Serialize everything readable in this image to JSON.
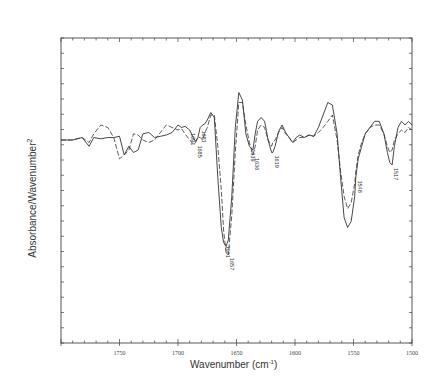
{
  "chart_data": {
    "type": "line",
    "title": "",
    "xlabel": "Wavenumber (cm⁻¹)",
    "xlabel_base": "Wavenumber (cm",
    "xlabel_sup": "-1",
    "xlabel_tail": ")",
    "ylabel": "Absorbance/Wavenumber²",
    "ylabel_base": "Absorbance/Wavenumber",
    "ylabel_sup": "2",
    "xlim": [
      1800,
      1500
    ],
    "x_reversed": true,
    "x_ticks": [
      1750,
      1700,
      1650,
      1600,
      1550,
      1500
    ],
    "x_tick_labels": [
      "1750",
      "1700",
      "1650",
      "1600",
      "1550",
      "1500"
    ],
    "y_tick_labels": [],
    "grid": false,
    "legend": null,
    "series": [
      {
        "name": "solid",
        "style": "solid",
        "x": [
          1800,
          1790,
          1782,
          1776,
          1772,
          1766,
          1760,
          1755,
          1750,
          1746,
          1742,
          1738,
          1734,
          1730,
          1725,
          1720,
          1715,
          1710,
          1705,
          1700,
          1697,
          1694,
          1690,
          1687,
          1685,
          1683,
          1681,
          1679,
          1677,
          1675,
          1672,
          1669,
          1666,
          1663,
          1661,
          1659,
          1657,
          1654,
          1651,
          1648,
          1645,
          1642,
          1639,
          1636,
          1634,
          1632,
          1629,
          1626,
          1623,
          1620,
          1619,
          1617,
          1614,
          1611,
          1608,
          1605,
          1602,
          1599,
          1596,
          1592,
          1588,
          1584,
          1580,
          1576,
          1572,
          1568,
          1564,
          1561,
          1558,
          1555,
          1552,
          1549,
          1548,
          1546,
          1543,
          1540,
          1536,
          1532,
          1528,
          1524,
          1521,
          1519,
          1517,
          1515,
          1512,
          1509,
          1506,
          1503,
          1500
        ],
        "y": [
          0,
          0,
          0.02,
          -0.05,
          0.02,
          0.01,
          0.02,
          0.02,
          0.03,
          -0.12,
          -0.05,
          -0.1,
          -0.08,
          0.05,
          0.06,
          0.02,
          0.03,
          0.04,
          0.06,
          0.12,
          0.1,
          0.11,
          0.08,
          0.02,
          -0.01,
          0.02,
          0.1,
          0.12,
          0.13,
          0.16,
          0.22,
          0.18,
          -0.3,
          -0.7,
          -0.82,
          -0.85,
          -0.8,
          -0.45,
          0.1,
          0.38,
          0.32,
          0.05,
          -0.05,
          -0.08,
          0.05,
          0.15,
          0.18,
          0.15,
          0.0,
          -0.1,
          -0.1,
          -0.05,
          0.07,
          0.12,
          0.06,
          0.02,
          -0.02,
          0.02,
          0.04,
          0.02,
          0.04,
          0.03,
          0.1,
          0.2,
          0.3,
          0.28,
          0.05,
          -0.3,
          -0.62,
          -0.7,
          -0.65,
          -0.45,
          -0.3,
          -0.15,
          -0.05,
          0.05,
          0.1,
          0.15,
          0.15,
          0.05,
          -0.1,
          -0.18,
          -0.2,
          -0.05,
          0.1,
          0.15,
          0.12,
          0.15,
          0.12
        ]
      },
      {
        "name": "dashed",
        "style": "dashed",
        "x": [
          1800,
          1790,
          1782,
          1776,
          1772,
          1766,
          1760,
          1755,
          1750,
          1746,
          1742,
          1738,
          1734,
          1730,
          1725,
          1720,
          1715,
          1710,
          1705,
          1700,
          1697,
          1694,
          1690,
          1687,
          1685,
          1683,
          1681,
          1679,
          1677,
          1675,
          1672,
          1669,
          1666,
          1663,
          1661,
          1659,
          1657,
          1654,
          1651,
          1648,
          1645,
          1642,
          1639,
          1636,
          1634,
          1632,
          1629,
          1626,
          1623,
          1620,
          1619,
          1617,
          1614,
          1611,
          1608,
          1605,
          1602,
          1599,
          1596,
          1592,
          1588,
          1584,
          1580,
          1576,
          1572,
          1568,
          1564,
          1561,
          1558,
          1555,
          1552,
          1549,
          1548,
          1546,
          1543,
          1540,
          1536,
          1532,
          1528,
          1524,
          1521,
          1519,
          1517,
          1515,
          1512,
          1509,
          1506,
          1503,
          1500
        ],
        "y": [
          0,
          0,
          0.02,
          -0.02,
          0.05,
          0.12,
          0.1,
          0.02,
          -0.15,
          -0.12,
          -0.08,
          0.05,
          0.04,
          0.0,
          -0.02,
          0.0,
          0.06,
          0.12,
          0.1,
          0.08,
          0.09,
          0.05,
          0.0,
          -0.03,
          -0.02,
          0.02,
          0.02,
          0.0,
          0.06,
          0.1,
          0.2,
          0.2,
          -0.05,
          -0.4,
          -0.72,
          -0.9,
          -0.92,
          -0.6,
          -0.1,
          0.3,
          0.3,
          0.12,
          -0.02,
          -0.12,
          -0.05,
          0.08,
          0.12,
          0.1,
          0.0,
          -0.05,
          -0.02,
          0.0,
          0.06,
          0.1,
          0.05,
          0.02,
          -0.02,
          0.0,
          0.02,
          0.02,
          0.04,
          0.03,
          0.06,
          0.1,
          0.15,
          0.2,
          0.0,
          -0.25,
          -0.45,
          -0.55,
          -0.5,
          -0.35,
          -0.25,
          -0.12,
          -0.02,
          0.05,
          0.1,
          0.12,
          0.12,
          0.05,
          -0.05,
          -0.1,
          -0.08,
          0.0,
          0.05,
          0.08,
          0.06,
          0.1,
          0.08
        ]
      }
    ],
    "annotations": [
      {
        "text": "1691",
        "x": 1691,
        "series": "solid"
      },
      {
        "text": "1685",
        "x": 1685,
        "series": "dashed"
      },
      {
        "text": "1681",
        "x": 1681,
        "series": "solid"
      },
      {
        "text": "1661",
        "x": 1661,
        "series": "solid"
      },
      {
        "text": "1657",
        "x": 1657,
        "series": "dashed"
      },
      {
        "text": "1639",
        "x": 1639,
        "series": "solid"
      },
      {
        "text": "1636",
        "x": 1636,
        "series": "dashed"
      },
      {
        "text": "1619",
        "x": 1619,
        "series": "solid"
      },
      {
        "text": "1548",
        "x": 1548,
        "series": "solid"
      },
      {
        "text": "1517",
        "x": 1517,
        "series": "solid"
      }
    ]
  }
}
